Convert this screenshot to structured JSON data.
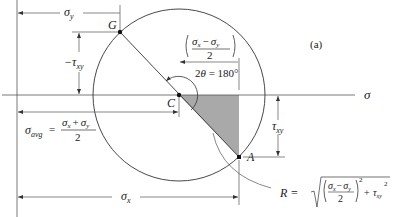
{
  "figure": {
    "label": "(a)",
    "type": "Mohr's circle"
  },
  "axes": {
    "sigma_axis_label": "σ"
  },
  "points": {
    "center": "C",
    "point_g": "G",
    "point_a": "A"
  },
  "dimensions": {
    "sigma_y": {
      "symbol": "σ",
      "sub": "y"
    },
    "neg_tau_xy": {
      "prefix": "−τ",
      "sub": "xy"
    },
    "half_diff": {
      "num_a": "σ",
      "num_a_sub": "x",
      "minus": "−",
      "num_b": "σ",
      "num_b_sub": "y",
      "den": "2"
    },
    "angle": {
      "text_a": "2",
      "theta": "θ",
      "text_b": " = 180°"
    },
    "sigma_avg": {
      "symbol": "σ",
      "sub": "avg",
      "eq": "=",
      "num_a": "σ",
      "num_a_sub": "x",
      "plus": "+",
      "num_b": "σ",
      "num_b_sub": "y",
      "den": "2"
    },
    "tau_xy": {
      "symbol": "τ",
      "sub": "xy"
    },
    "sigma_x": {
      "symbol": "σ",
      "sub": "x"
    },
    "radius": {
      "lhs": "R =",
      "num_a": "σ",
      "num_a_sub": "x",
      "minus": "−",
      "num_b": "σ",
      "num_b_sub": "y",
      "den": "2",
      "exp": "2",
      "plus": "+",
      "tau": "τ",
      "tau_sub": "xy",
      "tau_exp": "2"
    }
  },
  "colors": {
    "line": "#333333",
    "shade": "#a9a9a9",
    "text": "#222222"
  }
}
